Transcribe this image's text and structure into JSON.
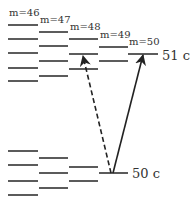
{
  "diagram": {
    "title": "",
    "columns": [
      {
        "label": "m=46",
        "x1": 8,
        "x2": 38,
        "label_y": 16,
        "upper": [
          25,
          39,
          53,
          68,
          81
        ],
        "lower": [
          151,
          165,
          181,
          195
        ]
      },
      {
        "label": "m=47",
        "x1": 39,
        "x2": 68,
        "label_y": 23,
        "upper": [
          32,
          46,
          61,
          76
        ],
        "lower": [
          158,
          173,
          188
        ]
      },
      {
        "label": "m=48",
        "x1": 69,
        "x2": 98,
        "label_y": 30,
        "upper": [
          39,
          54,
          69
        ],
        "lower": [
          167,
          181
        ]
      },
      {
        "label": "m=49",
        "x1": 99,
        "x2": 128,
        "label_y": 38,
        "upper": [
          47,
          61
        ],
        "lower": [
          173
        ]
      },
      {
        "label": "m=50",
        "x1": 128,
        "x2": 158,
        "label_y": 45,
        "upper": [
          54
        ],
        "lower": []
      }
    ],
    "levels": [
      {
        "label": "51 c",
        "x": 162,
        "y": 60
      },
      {
        "label": "50 c",
        "x": 132,
        "y": 178
      }
    ],
    "arrows": [
      {
        "name": "solid-transition",
        "style": "solid",
        "from": [
          113,
          173
        ],
        "to": [
          143,
          55
        ]
      },
      {
        "name": "dashed-transition",
        "style": "dashed",
        "from": [
          111,
          173
        ],
        "to": [
          83,
          56
        ]
      }
    ],
    "colors": {
      "line": "#333333",
      "background": "#ffffff"
    }
  }
}
